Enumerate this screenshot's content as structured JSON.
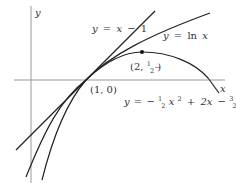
{
  "diagram": {
    "type": "function-graphs",
    "axes": {
      "x_label": "x",
      "y_label": "y",
      "color": "#999999"
    },
    "curves": [
      {
        "name": "tangent-line",
        "equation": "y = x − 1",
        "color": "#222222"
      },
      {
        "name": "natural-log",
        "equation": "y = ln x",
        "color": "#222222"
      },
      {
        "name": "parabola",
        "equation": "y = −½x² + 2x − 3/2",
        "color": "#222222"
      }
    ],
    "points": [
      {
        "label": "(1, 0)",
        "x": 1,
        "y": 0
      },
      {
        "label": "(2, ½)",
        "x": 2,
        "y": 0.5
      }
    ],
    "labels": {
      "line": {
        "y": "y",
        "eq": "=",
        "x": "x",
        "minus": "−",
        "one": "1"
      },
      "ln": {
        "y": "y",
        "eq": "=",
        "ln": "ln",
        "x": "x"
      },
      "parabola": {
        "y": "y",
        "eq": "=",
        "minus": "−",
        "one": "1",
        "two": "2",
        "x": "x",
        "sq": "2",
        "plus": "+",
        "twox": "2x",
        "minus2": "−",
        "three": "3",
        "two_b": "2"
      },
      "point_1_0": "(1, 0)",
      "point_2_half": {
        "open": "(2, ",
        "num": "1",
        "den": "2",
        "close": ")"
      }
    }
  }
}
